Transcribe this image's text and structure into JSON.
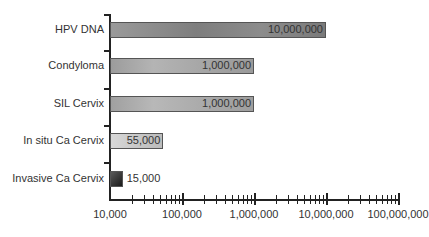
{
  "chart_data": {
    "type": "bar",
    "orientation": "horizontal",
    "xscale": "log",
    "title": "",
    "xlabel": "",
    "ylabel": "",
    "categories": [
      "HPV DNA",
      "Condyloma",
      "SIL Cervix",
      "In situ Ca Cervix",
      "Invasive Ca Cervix"
    ],
    "values": [
      10000000,
      1000000,
      1000000,
      55000,
      15000
    ],
    "value_labels": [
      "10,000,000",
      "1,000,000",
      "1,000,000",
      "55,000",
      "15,000"
    ],
    "xlim": [
      10000,
      100000000
    ],
    "x_tick_labels": [
      "10,000",
      "100,000",
      "1,000,000",
      "10,000,000",
      "100,000,000"
    ],
    "grid": false,
    "legend": null,
    "bar_colors": [
      "#8a8a8a",
      "#a0a0a0",
      "#a8a8a8",
      "#cfcfcf",
      "#2a2a2a"
    ]
  }
}
